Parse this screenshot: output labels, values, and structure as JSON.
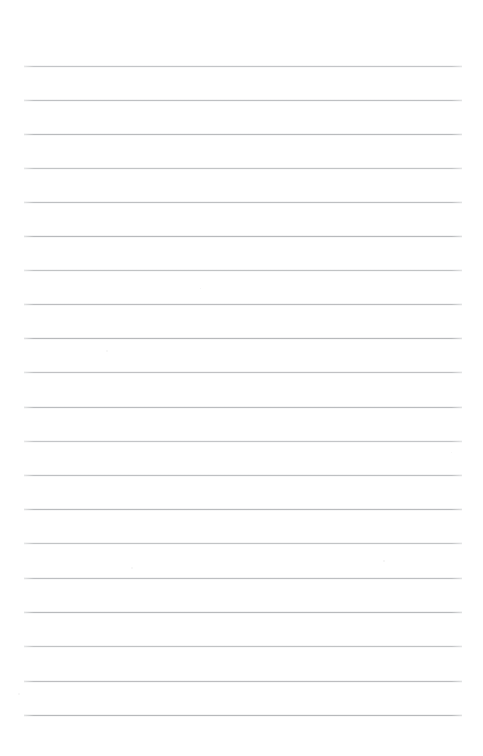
{
  "page": {
    "kind": "blank-ruled-notebook-page",
    "width_px": 483,
    "height_px": 756,
    "background_color": "#ffffff",
    "content_text": "",
    "has_text": false
  },
  "ruling": {
    "line_color": "#b9bbbd",
    "line_thickness_px": 1,
    "line_count": 20,
    "left_margin_px": 24,
    "right_margin_px": 462,
    "line_length_px": 438,
    "first_line_y_px": 66,
    "last_line_y_px": 715,
    "line_spacing_px": 34.2,
    "has_vertical_margin_rule": false,
    "line_positions_y": [
      66,
      100,
      134,
      168,
      202,
      236,
      270,
      304,
      338,
      372,
      407,
      441,
      475,
      509,
      543,
      578,
      612,
      646,
      681,
      715
    ]
  },
  "margins": {
    "top_blank_px": 66,
    "bottom_blank_px": 41,
    "left_blank_px": 24,
    "right_blank_px": 21
  },
  "speckles": [
    {
      "x": 106,
      "y": 350,
      "size": 2
    },
    {
      "x": 131,
      "y": 567,
      "size": 2
    },
    {
      "x": 18,
      "y": 693,
      "size": 2
    },
    {
      "x": 383,
      "y": 560,
      "size": 2
    },
    {
      "x": 200,
      "y": 288,
      "size": 1
    },
    {
      "x": 451,
      "y": 452,
      "size": 1
    }
  ]
}
